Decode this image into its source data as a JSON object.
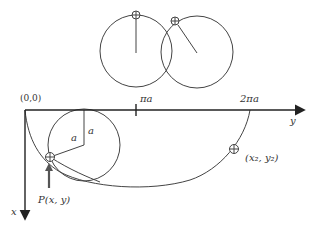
{
  "diagram": {
    "type": "cycloid-rolling-circle",
    "colors": {
      "line": "#444444",
      "axis": "#222222",
      "text": "#333333",
      "background": "#ffffff"
    },
    "labels": {
      "origin": "(0,0)",
      "tick_pi": "πa",
      "tick_2pi": "2πa",
      "y_axis": "y",
      "x_axis": "x",
      "radius_a_1": "a",
      "radius_a_2": "a",
      "point_p": "P(x, y)",
      "point_2": "(x₂, y₂)"
    },
    "elements": {
      "top_circles": [
        {
          "name": "circle-marker-top",
          "marker_position": "top"
        },
        {
          "name": "circle-marker-upper-left",
          "marker_position": "upper-left"
        }
      ],
      "rolling_circle": {
        "radius_label": "a"
      },
      "cycloid_curve": {
        "from": "(0,0)",
        "to": "2πa"
      }
    }
  }
}
